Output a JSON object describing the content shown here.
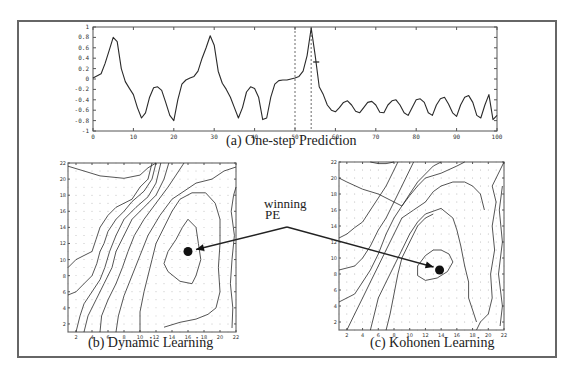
{
  "figure": {
    "frame_color": "#666666",
    "line_color": "#2a2a2a",
    "annotation": {
      "line1": "winning",
      "line2": "PE"
    }
  },
  "chart_data": [
    {
      "type": "line",
      "title": "(a) One-step Prediction",
      "xlabel": "",
      "ylabel": "",
      "xlim": [
        0,
        100
      ],
      "ylim": [
        -1,
        1
      ],
      "x_ticks": [
        "0",
        "10",
        "20",
        "30",
        "40",
        "50",
        "60",
        "70",
        "80",
        "90",
        "100"
      ],
      "y_ticks": [
        "1",
        "0.8",
        "0.6",
        "0.4",
        "0.2",
        "0",
        "-0.2",
        "-0.4",
        "-0.6",
        "-0.8",
        "-1"
      ],
      "grid": false,
      "vertical_markers": [
        50,
        54
      ],
      "series": [
        {
          "name": "signal",
          "x": [
            0,
            2,
            3,
            4,
            5,
            6,
            7,
            8,
            9,
            10,
            11,
            12,
            13,
            14,
            15,
            16,
            17,
            18,
            19,
            20,
            21,
            22,
            23,
            24,
            25,
            26,
            27,
            28,
            29,
            30,
            31,
            32,
            33,
            34,
            35,
            36,
            37,
            38,
            39,
            40,
            41,
            42,
            43,
            44,
            45,
            46,
            47,
            48,
            49,
            50,
            51,
            52,
            53,
            54,
            55,
            56,
            57,
            58,
            59,
            60,
            61,
            62,
            63,
            64,
            65,
            66,
            67,
            68,
            69,
            70,
            71,
            72,
            73,
            74,
            75,
            76,
            77,
            78,
            79,
            80,
            81,
            82,
            83,
            84,
            85,
            86,
            87,
            88,
            89,
            90,
            91,
            92,
            93,
            94,
            95,
            96,
            97,
            98,
            99,
            100
          ],
          "y": [
            0.02,
            0.1,
            0.3,
            0.55,
            0.8,
            0.72,
            0.2,
            -0.05,
            -0.18,
            -0.3,
            -0.55,
            -0.75,
            -0.65,
            -0.35,
            -0.17,
            -0.15,
            -0.22,
            -0.45,
            -0.7,
            -0.8,
            -0.4,
            -0.1,
            -0.02,
            0.02,
            0.05,
            0.15,
            0.4,
            0.6,
            0.83,
            0.65,
            0.15,
            -0.08,
            -0.2,
            -0.35,
            -0.55,
            -0.75,
            -0.55,
            -0.25,
            -0.15,
            -0.18,
            -0.35,
            -0.78,
            -0.75,
            -0.35,
            -0.1,
            -0.03,
            -0.02,
            -0.02,
            0.0,
            0.02,
            0.05,
            0.15,
            0.45,
            0.98,
            0.45,
            -0.15,
            -0.3,
            -0.5,
            -0.6,
            -0.63,
            -0.55,
            -0.45,
            -0.42,
            -0.5,
            -0.62,
            -0.65,
            -0.55,
            -0.45,
            -0.43,
            -0.5,
            -0.64,
            -0.65,
            -0.5,
            -0.42,
            -0.4,
            -0.5,
            -0.65,
            -0.7,
            -0.55,
            -0.4,
            -0.38,
            -0.45,
            -0.65,
            -0.7,
            -0.5,
            -0.38,
            -0.35,
            -0.48,
            -0.65,
            -0.72,
            -0.5,
            -0.35,
            -0.32,
            -0.45,
            -0.7,
            -0.75,
            -0.5,
            -0.3,
            -0.78,
            -0.7
          ]
        }
      ]
    },
    {
      "type": "contour",
      "title": "(b) Dynamic Learning",
      "xlim": [
        1,
        22
      ],
      "ylim": [
        1,
        22
      ],
      "x_ticks": [
        "2",
        "4",
        "6",
        "8",
        "10",
        "12",
        "14",
        "16",
        "18",
        "20",
        "22"
      ],
      "y_ticks": [
        "2",
        "4",
        "6",
        "8",
        "10",
        "12",
        "14",
        "16",
        "18",
        "20",
        "22"
      ],
      "grid": "dot-lattice",
      "winning_pe": {
        "x": 16,
        "y": 11
      }
    },
    {
      "type": "contour",
      "title": "(c) Kohonen Learning",
      "xlim": [
        1,
        22
      ],
      "ylim": [
        1,
        22
      ],
      "x_ticks": [
        "2",
        "4",
        "6",
        "8",
        "10",
        "12",
        "14",
        "16",
        "18",
        "20",
        "22"
      ],
      "y_ticks": [
        "2",
        "4",
        "6",
        "8",
        "10",
        "12",
        "14",
        "16",
        "18",
        "20",
        "22"
      ],
      "grid": "dot-lattice",
      "winning_pe": {
        "x": 13.8,
        "y": 8.5
      }
    }
  ]
}
